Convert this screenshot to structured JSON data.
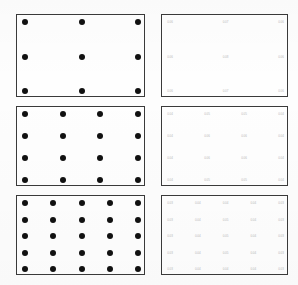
{
  "figure": {
    "caption": "",
    "panel_rows": 3,
    "panel_cols": 2,
    "dot_color": "#111111",
    "border_color": "#3a3a3a",
    "label_color": "#b9b9b9",
    "background_color": "#fefefe"
  },
  "panels": [
    {
      "id": "panel-top-left",
      "name": "3x3 dot grid",
      "kind": "dots",
      "rows": 3,
      "cols": 3,
      "x": 16,
      "y": 14,
      "width": 129,
      "height": 83
    },
    {
      "id": "panel-top-right",
      "name": "3x3 label grid",
      "kind": "labels",
      "rows": 3,
      "cols": 3,
      "x": 161,
      "y": 14,
      "width": 127,
      "height": 83,
      "labels": [
        [
          "0.06",
          "0.07",
          "0.06"
        ],
        [
          "0.06",
          "0.08",
          "0.06"
        ],
        [
          "0.06",
          "0.07",
          "0.06"
        ]
      ]
    },
    {
      "id": "panel-middle-left",
      "name": "4x4 dot grid",
      "kind": "dots",
      "rows": 4,
      "cols": 4,
      "x": 16,
      "y": 106,
      "width": 129,
      "height": 80
    },
    {
      "id": "panel-middle-right",
      "name": "4x4 label grid",
      "kind": "labels",
      "rows": 4,
      "cols": 4,
      "x": 161,
      "y": 106,
      "width": 127,
      "height": 80,
      "labels": [
        [
          "0.04",
          "0.05",
          "0.05",
          "0.04"
        ],
        [
          "0.04",
          "0.06",
          "0.06",
          "0.04"
        ],
        [
          "0.04",
          "0.06",
          "0.06",
          "0.04"
        ],
        [
          "0.04",
          "0.05",
          "0.05",
          "0.04"
        ]
      ]
    },
    {
      "id": "panel-bottom-left",
      "name": "5x5 dot grid",
      "kind": "dots",
      "rows": 5,
      "cols": 5,
      "x": 16,
      "y": 195,
      "width": 129,
      "height": 80
    },
    {
      "id": "panel-bottom-right",
      "name": "5x5 label grid",
      "kind": "labels",
      "rows": 5,
      "cols": 5,
      "x": 161,
      "y": 195,
      "width": 127,
      "height": 80,
      "labels": [
        [
          "0.03",
          "0.04",
          "0.04",
          "0.04",
          "0.03"
        ],
        [
          "0.03",
          "0.04",
          "0.05",
          "0.04",
          "0.03"
        ],
        [
          "0.03",
          "0.04",
          "0.05",
          "0.04",
          "0.03"
        ],
        [
          "0.03",
          "0.04",
          "0.05",
          "0.04",
          "0.03"
        ],
        [
          "0.03",
          "0.04",
          "0.04",
          "0.04",
          "0.03"
        ]
      ]
    }
  ]
}
